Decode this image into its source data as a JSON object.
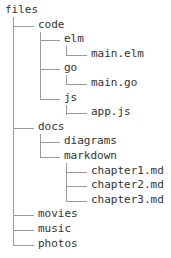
{
  "tree": {
    "root": "files",
    "nodes": [
      {
        "label": "code",
        "depth": 1
      },
      {
        "label": "elm",
        "depth": 2
      },
      {
        "label": "main.elm",
        "depth": 3
      },
      {
        "label": "go",
        "depth": 2
      },
      {
        "label": "main.go",
        "depth": 3
      },
      {
        "label": "js",
        "depth": 2
      },
      {
        "label": "app.js",
        "depth": 3
      },
      {
        "label": "docs",
        "depth": 1
      },
      {
        "label": "diagrams",
        "depth": 2
      },
      {
        "label": "markdown",
        "depth": 2
      },
      {
        "label": "chapter1.md",
        "depth": 3
      },
      {
        "label": "chapter2.md",
        "depth": 3
      },
      {
        "label": "chapter3.md",
        "depth": 3
      },
      {
        "label": "movies",
        "depth": 1
      },
      {
        "label": "music",
        "depth": 1
      },
      {
        "label": "photos",
        "depth": 1
      }
    ]
  }
}
